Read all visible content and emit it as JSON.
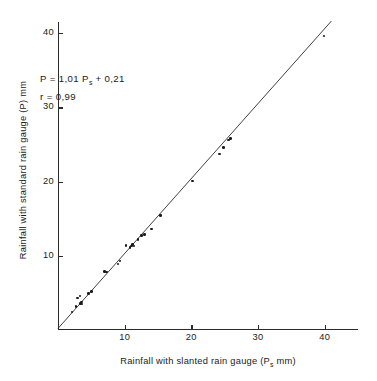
{
  "chart_data": {
    "type": "scatter",
    "title": "",
    "xlabel": "Rainfall with slanted rain gauge  (P",
    "xlabel_sub": "s",
    "xlabel_tail": "  mm)",
    "ylabel": "Rainfall with standard rain gauge (P) mm",
    "xlim": [
      0,
      45
    ],
    "ylim": [
      0,
      41.5
    ],
    "xticks": [
      10,
      20,
      30,
      40
    ],
    "yticks": [
      10,
      20,
      30,
      40
    ],
    "xticklabels": [
      "10",
      "20",
      "30",
      "40"
    ],
    "yticklabels": [
      "10",
      "20",
      "30",
      "40"
    ],
    "grid": false,
    "legend": null,
    "annotations": {
      "equation_prefix": "P  =  1,01  P",
      "equation_sub": "s",
      "equation_tail": "  +  0,21",
      "correlation": "r  =  0,99",
      "slope": 1.01,
      "intercept": 0.21,
      "r": 0.99
    },
    "fit_line": {
      "type": "linear",
      "slope": 1.01,
      "intercept": 0.21,
      "x_start": 0.0,
      "x_end": 41.0
    },
    "marker": "dot",
    "marker_color": "#1a1a1a",
    "line_color": "#2b2b2b",
    "axis_color": "#2b2b2b",
    "background": "#ffffff",
    "points": [
      {
        "x": 2.1,
        "y": 2.4
      },
      {
        "x": 2.7,
        "y": 3.2
      },
      {
        "x": 2.9,
        "y": 4.3
      },
      {
        "x": 3.3,
        "y": 4.6
      },
      {
        "x": 3.4,
        "y": 3.6
      },
      {
        "x": 3.5,
        "y": 3.8
      },
      {
        "x": 3.6,
        "y": 3.5
      },
      {
        "x": 4.6,
        "y": 4.9
      },
      {
        "x": 5.0,
        "y": 5.2
      },
      {
        "x": 7.0,
        "y": 7.9
      },
      {
        "x": 7.3,
        "y": 7.8
      },
      {
        "x": 9.0,
        "y": 8.9
      },
      {
        "x": 9.3,
        "y": 9.3
      },
      {
        "x": 10.2,
        "y": 11.4
      },
      {
        "x": 10.8,
        "y": 11.1
      },
      {
        "x": 11.0,
        "y": 11.3
      },
      {
        "x": 11.2,
        "y": 11.5
      },
      {
        "x": 11.4,
        "y": 11.3
      },
      {
        "x": 12.0,
        "y": 12.2
      },
      {
        "x": 12.5,
        "y": 12.7
      },
      {
        "x": 13.0,
        "y": 12.9
      },
      {
        "x": 14.0,
        "y": 13.6
      },
      {
        "x": 15.4,
        "y": 15.4
      },
      {
        "x": 20.2,
        "y": 20.1
      },
      {
        "x": 24.2,
        "y": 23.7
      },
      {
        "x": 24.8,
        "y": 24.6
      },
      {
        "x": 25.6,
        "y": 25.6
      },
      {
        "x": 25.9,
        "y": 25.8
      },
      {
        "x": 39.9,
        "y": 39.6
      }
    ]
  }
}
